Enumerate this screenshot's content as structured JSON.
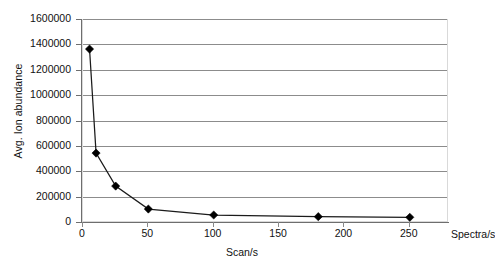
{
  "chart_data": {
    "type": "line",
    "title": "",
    "xlabel": "Scan/s",
    "ylabel": "Avg. Ion abundance",
    "x_end_label": "Spectra/s",
    "xlim": [
      0,
      280
    ],
    "ylim": [
      0,
      1600000
    ],
    "grid": true,
    "legend": "none",
    "marker": "diamond",
    "series_color": "#000000",
    "gridline_color": "#8c8c8c",
    "x_ticks": [
      0,
      50,
      100,
      150,
      200,
      250
    ],
    "x_tick_labels": [
      "0",
      "50",
      "100",
      "150",
      "200",
      "250"
    ],
    "y_ticks": [
      0,
      200000,
      400000,
      600000,
      800000,
      1000000,
      1200000,
      1400000,
      1600000
    ],
    "y_tick_labels": [
      "0",
      "200000",
      "400000",
      "600000",
      "800000",
      "1000000",
      "1200000",
      "1400000",
      "1600000"
    ],
    "x": [
      5,
      10,
      25,
      50,
      100,
      180,
      250
    ],
    "values": [
      1371000,
      551000,
      291000,
      110000,
      63000,
      50000,
      45000
    ],
    "points": [
      {
        "x": 5,
        "y": 1371000
      },
      {
        "x": 10,
        "y": 551000
      },
      {
        "x": 25,
        "y": 291000
      },
      {
        "x": 50,
        "y": 110000
      },
      {
        "x": 100,
        "y": 63000
      },
      {
        "x": 180,
        "y": 50000
      },
      {
        "x": 250,
        "y": 45000
      }
    ]
  }
}
